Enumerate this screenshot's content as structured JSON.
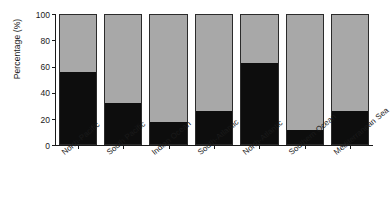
{
  "chart_data": {
    "type": "bar",
    "subtype": "stacked-percentage",
    "title": "",
    "xlabel": "",
    "ylabel": "Percentage (%)",
    "ylim": [
      0,
      100
    ],
    "yticks": [
      0,
      20,
      40,
      60,
      80,
      100
    ],
    "grid": false,
    "legend": "none",
    "categories": [
      "North-Pacific",
      "South Pacific",
      "Indian Ocean",
      "South-Atlantic",
      "North-Atlantic",
      "Southern Ocean",
      "Mediterranean Sea"
    ],
    "series": [
      {
        "name": "black-segment",
        "color": "#0d0d0d",
        "values": [
          55,
          31,
          17,
          25,
          62,
          11,
          25
        ]
      },
      {
        "name": "gray-segment",
        "color": "#a8a8a8",
        "values": [
          45,
          69,
          83,
          75,
          38,
          89,
          75
        ]
      }
    ]
  },
  "axis": {
    "y_title": "Percentage (%)",
    "tick_labels": [
      "0",
      "20",
      "40",
      "60",
      "80",
      "100"
    ]
  }
}
